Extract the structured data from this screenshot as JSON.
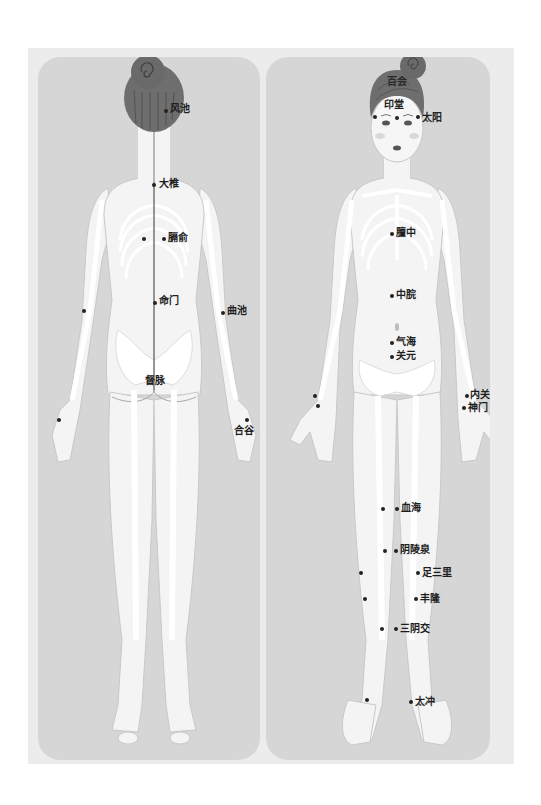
{
  "diagram": {
    "type": "acupuncture-point-chart",
    "views": [
      {
        "id": "back",
        "label_points": [
          {
            "name": "风池",
            "label_x": 172,
            "label_y": 107,
            "dot_x": 166,
            "dot_y": 111
          },
          {
            "name": "大椎",
            "label_x": 160,
            "label_y": 181,
            "dot_x": 154,
            "dot_y": 185
          },
          {
            "name": "膈俞",
            "label_x": 169,
            "label_y": 235,
            "dot_x": 164,
            "dot_y": 239
          },
          {
            "name": "命门",
            "label_x": 161,
            "label_y": 298,
            "dot_x": 155,
            "dot_y": 303
          },
          {
            "name": "曲池",
            "label_x": 229,
            "label_y": 308,
            "dot_x": 223,
            "dot_y": 313
          },
          {
            "name": "督脉",
            "label_x": 146,
            "label_y": 377,
            "dot_x": null,
            "dot_y": null
          },
          {
            "name": "合谷",
            "label_x": 234,
            "label_y": 424,
            "dot_x": 247,
            "dot_y": 420
          }
        ],
        "unlabeled_dots": [
          {
            "x": 144,
            "y": 239
          },
          {
            "x": 84,
            "y": 311
          },
          {
            "x": 59,
            "y": 420
          }
        ]
      },
      {
        "id": "front",
        "label_points": [
          {
            "name": "百会",
            "label_x": 387,
            "label_y": 77,
            "dot_x": null,
            "dot_y": null
          },
          {
            "name": "印堂",
            "label_x": 384,
            "label_y": 101,
            "dot_x": 397,
            "dot_y": 118
          },
          {
            "name": "太阳",
            "label_x": 425,
            "label_y": 114,
            "dot_x": 418,
            "dot_y": 117
          },
          {
            "name": "膻中",
            "label_x": 397,
            "label_y": 229,
            "dot_x": 392,
            "dot_y": 234
          },
          {
            "name": "中脘",
            "label_x": 397,
            "label_y": 291,
            "dot_x": 392,
            "dot_y": 296
          },
          {
            "name": "气海",
            "label_x": 397,
            "label_y": 339,
            "dot_x": 392,
            "dot_y": 343
          },
          {
            "name": "关元",
            "label_x": 397,
            "label_y": 353,
            "dot_x": 392,
            "dot_y": 357
          },
          {
            "name": "内关",
            "label_x": 470,
            "label_y": 392,
            "dot_x": 467,
            "dot_y": 396
          },
          {
            "name": "神门",
            "label_x": 468,
            "label_y": 405,
            "dot_x": 464,
            "dot_y": 408
          },
          {
            "name": "血海",
            "label_x": 402,
            "label_y": 504,
            "dot_x": 397,
            "dot_y": 509
          },
          {
            "name": "阴陵泉",
            "label_x": 401,
            "label_y": 546,
            "dot_x": 396,
            "dot_y": 551
          },
          {
            "name": "足三里",
            "label_x": 423,
            "label_y": 569,
            "dot_x": 418,
            "dot_y": 573
          },
          {
            "name": "丰隆",
            "label_x": 421,
            "label_y": 596,
            "dot_x": 416,
            "dot_y": 599
          },
          {
            "name": "三阴交",
            "label_x": 400,
            "label_y": 625,
            "dot_x": 396,
            "dot_y": 629
          },
          {
            "name": "太冲",
            "label_x": 416,
            "label_y": 699,
            "dot_x": 411,
            "dot_y": 702
          }
        ],
        "unlabeled_dots": [
          {
            "x": 383,
            "y": 509
          },
          {
            "x": 385,
            "y": 551
          },
          {
            "x": 361,
            "y": 573
          },
          {
            "x": 365,
            "y": 599
          },
          {
            "x": 382,
            "y": 629
          },
          {
            "x": 367,
            "y": 700
          },
          {
            "x": 315,
            "y": 396
          },
          {
            "x": 318,
            "y": 406
          }
        ]
      }
    ],
    "colors": {
      "frame_bg": "#ececec",
      "panel_bg": "#d6d6d6",
      "skin": "#f4f4f4",
      "bone": "#ffffff",
      "hair": "#6e6e6e",
      "label": "#1e1e1e"
    }
  }
}
